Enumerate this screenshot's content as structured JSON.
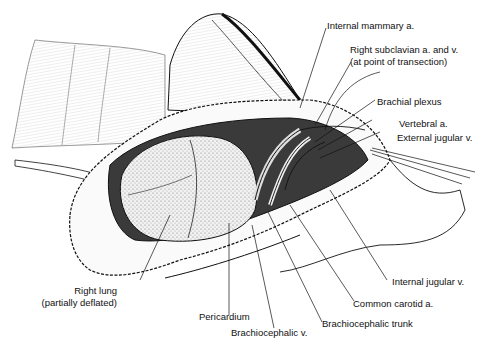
{
  "figure": {
    "type": "anatomical-illustration"
  },
  "labels": {
    "internal_mammary": "Internal mammary a.",
    "right_subclavian_1": "Right subclavian a. and v.",
    "right_subclavian_2": "(at point of transection)",
    "brachial_plexus": "Brachial plexus",
    "vertebral": "Vertebral a.",
    "external_jugular": "External jugular v.",
    "right_lung_1": "Right lung",
    "right_lung_2": "(partially deflated)",
    "pericardium": "Pericardium",
    "brachiocephalic_v": "Brachiocephalic v.",
    "brachiocephalic_trunk": "Brachiocephalic trunk",
    "common_carotid": "Common carotid a.",
    "internal_jugular": "Internal jugular v."
  },
  "colors": {
    "ink": "#111111",
    "paper": "#ffffff",
    "stipple": "#9a9a9a"
  }
}
